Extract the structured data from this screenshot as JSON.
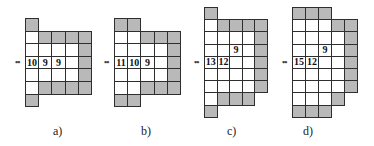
{
  "colors": {
    "shaded": "#b9b9b9",
    "open": "#ffffff",
    "border": "#2e2e2e"
  },
  "figures": [
    {
      "id": "a",
      "caption": "a)",
      "origin": [
        25,
        18
      ],
      "cell": [
        13.2,
        12.6
      ],
      "caption_x": 53,
      "marker": {
        "text": "••",
        "row": 3
      },
      "cells": [
        {
          "c": 0,
          "r": 0,
          "g": 1
        },
        {
          "c": 0,
          "r": 1,
          "g": 0
        },
        {
          "c": 0,
          "r": 2,
          "g": 0
        },
        {
          "c": 0,
          "r": 3,
          "g": 0,
          "t": "10"
        },
        {
          "c": 0,
          "r": 4,
          "g": 0
        },
        {
          "c": 0,
          "r": 5,
          "g": 0
        },
        {
          "c": 0,
          "r": 6,
          "g": 1
        },
        {
          "c": 1,
          "r": 1,
          "g": 1
        },
        {
          "c": 1,
          "r": 2,
          "g": 0
        },
        {
          "c": 1,
          "r": 3,
          "g": 0,
          "t": "9"
        },
        {
          "c": 1,
          "r": 4,
          "g": 0
        },
        {
          "c": 1,
          "r": 5,
          "g": 1
        },
        {
          "c": 2,
          "r": 1,
          "g": 1
        },
        {
          "c": 2,
          "r": 2,
          "g": 0
        },
        {
          "c": 2,
          "r": 3,
          "g": 0,
          "t": "9"
        },
        {
          "c": 2,
          "r": 4,
          "g": 0
        },
        {
          "c": 2,
          "r": 5,
          "g": 1
        },
        {
          "c": 3,
          "r": 1,
          "g": 1
        },
        {
          "c": 3,
          "r": 2,
          "g": 0
        },
        {
          "c": 3,
          "r": 3,
          "g": 0
        },
        {
          "c": 3,
          "r": 4,
          "g": 0
        },
        {
          "c": 3,
          "r": 5,
          "g": 1
        },
        {
          "c": 4,
          "r": 1,
          "g": 1
        },
        {
          "c": 4,
          "r": 2,
          "g": 1
        },
        {
          "c": 4,
          "r": 3,
          "g": 1
        },
        {
          "c": 4,
          "r": 4,
          "g": 1
        },
        {
          "c": 4,
          "r": 5,
          "g": 1
        }
      ]
    },
    {
      "id": "b",
      "caption": "b)",
      "origin": [
        114,
        18
      ],
      "cell": [
        13.2,
        12.6
      ],
      "caption_x": 141,
      "marker": {
        "text": "••",
        "row": 3
      },
      "cells": [
        {
          "c": 0,
          "r": 0,
          "g": 1
        },
        {
          "c": 0,
          "r": 1,
          "g": 0
        },
        {
          "c": 0,
          "r": 2,
          "g": 0
        },
        {
          "c": 0,
          "r": 3,
          "g": 0,
          "t": "11"
        },
        {
          "c": 0,
          "r": 4,
          "g": 0
        },
        {
          "c": 0,
          "r": 5,
          "g": 0
        },
        {
          "c": 0,
          "r": 6,
          "g": 1
        },
        {
          "c": 1,
          "r": 0,
          "g": 1
        },
        {
          "c": 1,
          "r": 1,
          "g": 0
        },
        {
          "c": 1,
          "r": 2,
          "g": 0
        },
        {
          "c": 1,
          "r": 3,
          "g": 0,
          "t": "10"
        },
        {
          "c": 1,
          "r": 4,
          "g": 0
        },
        {
          "c": 1,
          "r": 5,
          "g": 0
        },
        {
          "c": 1,
          "r": 6,
          "g": 1
        },
        {
          "c": 2,
          "r": 1,
          "g": 1
        },
        {
          "c": 2,
          "r": 2,
          "g": 0
        },
        {
          "c": 2,
          "r": 3,
          "g": 0,
          "t": "9"
        },
        {
          "c": 2,
          "r": 4,
          "g": 0
        },
        {
          "c": 2,
          "r": 5,
          "g": 1
        },
        {
          "c": 3,
          "r": 1,
          "g": 1
        },
        {
          "c": 3,
          "r": 2,
          "g": 0
        },
        {
          "c": 3,
          "r": 3,
          "g": 0
        },
        {
          "c": 3,
          "r": 4,
          "g": 0
        },
        {
          "c": 3,
          "r": 5,
          "g": 1
        },
        {
          "c": 4,
          "r": 1,
          "g": 1
        },
        {
          "c": 4,
          "r": 2,
          "g": 1
        },
        {
          "c": 4,
          "r": 3,
          "g": 1
        },
        {
          "c": 4,
          "r": 4,
          "g": 1
        },
        {
          "c": 4,
          "r": 5,
          "g": 1
        }
      ]
    },
    {
      "id": "c",
      "caption": "c)",
      "origin": [
        204,
        7
      ],
      "cell": [
        12.6,
        12.2
      ],
      "caption_x": 227,
      "marker": {
        "text": "••",
        "row": 4
      },
      "cells": [
        {
          "c": 0,
          "r": 0,
          "g": 1
        },
        {
          "c": 0,
          "r": 1,
          "g": 0
        },
        {
          "c": 0,
          "r": 2,
          "g": 0
        },
        {
          "c": 0,
          "r": 3,
          "g": 0
        },
        {
          "c": 0,
          "r": 4,
          "g": 0,
          "t": "13"
        },
        {
          "c": 0,
          "r": 5,
          "g": 0
        },
        {
          "c": 0,
          "r": 6,
          "g": 0
        },
        {
          "c": 0,
          "r": 7,
          "g": 0
        },
        {
          "c": 0,
          "r": 8,
          "g": 1
        },
        {
          "c": 1,
          "r": 1,
          "g": 1
        },
        {
          "c": 1,
          "r": 2,
          "g": 0
        },
        {
          "c": 1,
          "r": 3,
          "g": 0
        },
        {
          "c": 1,
          "r": 4,
          "g": 0,
          "t": "12"
        },
        {
          "c": 1,
          "r": 5,
          "g": 0
        },
        {
          "c": 1,
          "r": 6,
          "g": 0
        },
        {
          "c": 1,
          "r": 7,
          "g": 1
        },
        {
          "c": 2,
          "r": 1,
          "g": 1
        },
        {
          "c": 2,
          "r": 2,
          "g": 0
        },
        {
          "c": 2,
          "r": 3,
          "g": 0,
          "t": "9"
        },
        {
          "c": 2,
          "r": 4,
          "g": 0
        },
        {
          "c": 2,
          "r": 5,
          "g": 0
        },
        {
          "c": 2,
          "r": 6,
          "g": 0
        },
        {
          "c": 2,
          "r": 7,
          "g": 1
        },
        {
          "c": 3,
          "r": 1,
          "g": 1
        },
        {
          "c": 3,
          "r": 2,
          "g": 0
        },
        {
          "c": 3,
          "r": 3,
          "g": 0
        },
        {
          "c": 3,
          "r": 4,
          "g": 0
        },
        {
          "c": 3,
          "r": 5,
          "g": 0
        },
        {
          "c": 3,
          "r": 6,
          "g": 0
        },
        {
          "c": 3,
          "r": 7,
          "g": 1
        },
        {
          "c": 4,
          "r": 1,
          "g": 1
        },
        {
          "c": 4,
          "r": 2,
          "g": 1
        },
        {
          "c": 4,
          "r": 3,
          "g": 1
        },
        {
          "c": 4,
          "r": 4,
          "g": 1
        },
        {
          "c": 4,
          "r": 5,
          "g": 1
        },
        {
          "c": 4,
          "r": 6,
          "g": 1
        }
      ]
    },
    {
      "id": "d",
      "caption": "d)",
      "origin": [
        292,
        7
      ],
      "cell": [
        13.0,
        12.2
      ],
      "caption_x": 303,
      "marker": {
        "text": "••",
        "row": 4
      },
      "cells": [
        {
          "c": 0,
          "r": 0,
          "g": 1
        },
        {
          "c": 0,
          "r": 1,
          "g": 0
        },
        {
          "c": 0,
          "r": 2,
          "g": 0
        },
        {
          "c": 0,
          "r": 3,
          "g": 0
        },
        {
          "c": 0,
          "r": 4,
          "g": 0,
          "t": "15"
        },
        {
          "c": 0,
          "r": 5,
          "g": 0
        },
        {
          "c": 0,
          "r": 6,
          "g": 0
        },
        {
          "c": 0,
          "r": 7,
          "g": 0
        },
        {
          "c": 0,
          "r": 8,
          "g": 1
        },
        {
          "c": 1,
          "r": 0,
          "g": 1
        },
        {
          "c": 1,
          "r": 1,
          "g": 0
        },
        {
          "c": 1,
          "r": 2,
          "g": 0
        },
        {
          "c": 1,
          "r": 3,
          "g": 0
        },
        {
          "c": 1,
          "r": 4,
          "g": 0,
          "t": "12"
        },
        {
          "c": 1,
          "r": 5,
          "g": 0
        },
        {
          "c": 1,
          "r": 6,
          "g": 0
        },
        {
          "c": 1,
          "r": 7,
          "g": 0
        },
        {
          "c": 1,
          "r": 8,
          "g": 1
        },
        {
          "c": 2,
          "r": 0,
          "g": 1
        },
        {
          "c": 2,
          "r": 1,
          "g": 0
        },
        {
          "c": 2,
          "r": 2,
          "g": 0
        },
        {
          "c": 2,
          "r": 3,
          "g": 0,
          "t": "9"
        },
        {
          "c": 2,
          "r": 4,
          "g": 0
        },
        {
          "c": 2,
          "r": 5,
          "g": 0
        },
        {
          "c": 2,
          "r": 6,
          "g": 0
        },
        {
          "c": 2,
          "r": 7,
          "g": 0
        },
        {
          "c": 2,
          "r": 8,
          "g": 1
        },
        {
          "c": 3,
          "r": 1,
          "g": 1
        },
        {
          "c": 3,
          "r": 2,
          "g": 0
        },
        {
          "c": 3,
          "r": 3,
          "g": 0
        },
        {
          "c": 3,
          "r": 4,
          "g": 0
        },
        {
          "c": 3,
          "r": 5,
          "g": 0
        },
        {
          "c": 3,
          "r": 6,
          "g": 0
        },
        {
          "c": 3,
          "r": 7,
          "g": 1
        },
        {
          "c": 4,
          "r": 1,
          "g": 1
        },
        {
          "c": 4,
          "r": 2,
          "g": 1
        },
        {
          "c": 4,
          "r": 3,
          "g": 1
        },
        {
          "c": 4,
          "r": 4,
          "g": 1
        },
        {
          "c": 4,
          "r": 5,
          "g": 1
        },
        {
          "c": 4,
          "r": 6,
          "g": 1
        }
      ]
    }
  ]
}
